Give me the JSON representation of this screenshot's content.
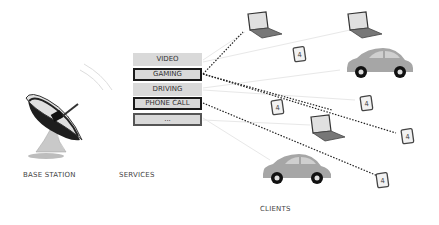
{
  "diagram": {
    "labels": {
      "base_station": "BASE STATION",
      "services": "SERVICES",
      "clients": "CLIENTS"
    },
    "services": [
      {
        "label": "VIDEO",
        "highlighted": false
      },
      {
        "label": "GAMING",
        "highlighted": true
      },
      {
        "label": "DRIVING",
        "highlighted": false
      },
      {
        "label": "PHONE CALL",
        "highlighted": true
      },
      {
        "label": "...",
        "highlighted": false
      }
    ],
    "clients": [
      {
        "type": "laptop",
        "icon": "laptop-icon"
      },
      {
        "type": "laptop",
        "icon": "laptop-icon"
      },
      {
        "type": "phone",
        "icon": "phone-icon"
      },
      {
        "type": "car",
        "icon": "car-icon"
      },
      {
        "type": "phone",
        "icon": "phone-icon"
      },
      {
        "type": "phone",
        "icon": "phone-icon"
      },
      {
        "type": "laptop",
        "icon": "laptop-icon"
      },
      {
        "type": "phone",
        "icon": "phone-icon"
      },
      {
        "type": "car",
        "icon": "car-icon"
      },
      {
        "type": "phone",
        "icon": "phone-icon"
      }
    ],
    "colors": {
      "service_box": "#d9d9d9",
      "highlight_border": "#1a1a1a",
      "dotted_line": "#222222",
      "faint_line": "#e6e6e6",
      "car_body": "#a6a6a6"
    }
  }
}
